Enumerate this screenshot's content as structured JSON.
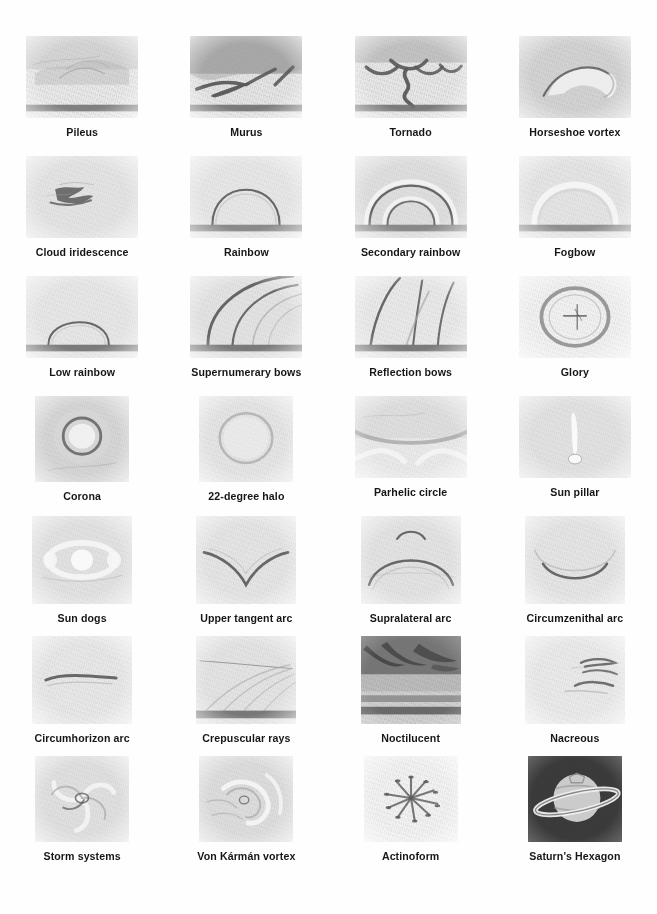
{
  "page": {
    "background_color": "#ffffff",
    "caption_color": "#15161a",
    "columns": 4,
    "rows": 7
  },
  "items": [
    {
      "label": "Pileus",
      "icon": "pileus-sketch",
      "sky": "#e8e8e8",
      "ground": true,
      "shape": "wide"
    },
    {
      "label": "Murus",
      "icon": "murus-sketch",
      "sky": "#e4e4e4",
      "ground": true,
      "shape": "wide"
    },
    {
      "label": "Tornado",
      "icon": "tornado-sketch",
      "sky": "#e6e6e6",
      "ground": true,
      "shape": "wide"
    },
    {
      "label": "Horseshoe vortex",
      "icon": "horseshoe-vortex-sketch",
      "sky": "#e3e3e3",
      "ground": false,
      "shape": "wide"
    },
    {
      "label": "Cloud iridescence",
      "icon": "cloud-iridescence-sketch",
      "sky": "#eaeaea",
      "ground": false,
      "shape": "wide"
    },
    {
      "label": "Rainbow",
      "icon": "rainbow-sketch",
      "sky": "#ececec",
      "ground": true,
      "shape": "wide"
    },
    {
      "label": "Secondary rainbow",
      "icon": "secondary-rainbow-sketch",
      "sky": "#e7e7e7",
      "ground": true,
      "shape": "wide"
    },
    {
      "label": "Fogbow",
      "icon": "fogbow-sketch",
      "sky": "#e9e9e9",
      "ground": true,
      "shape": "wide"
    },
    {
      "label": "Low rainbow",
      "icon": "low-rainbow-sketch",
      "sky": "#eaeaea",
      "ground": true,
      "shape": "wide"
    },
    {
      "label": "Supernumerary bows",
      "icon": "supernumerary-bows-sketch",
      "sky": "#e9e9e9",
      "ground": true,
      "shape": "wide"
    },
    {
      "label": "Reflection bows",
      "icon": "reflection-bows-sketch",
      "sky": "#ececec",
      "ground": true,
      "shape": "wide"
    },
    {
      "label": "Glory",
      "icon": "glory-sketch",
      "sky": "#f0f0f0",
      "ground": false,
      "shape": "wide"
    },
    {
      "label": "Corona",
      "icon": "corona-sketch",
      "sky": "#e4e4e4",
      "ground": false,
      "shape": "sq"
    },
    {
      "label": "22-degree halo",
      "icon": "halo-22-degree-sketch",
      "sky": "#e9e9e9",
      "ground": false,
      "shape": "sq"
    },
    {
      "label": "Parhelic circle",
      "icon": "parhelic-circle-sketch",
      "sky": "#e8e8e8",
      "ground": false,
      "shape": "wide"
    },
    {
      "label": "Sun pillar",
      "icon": "sun-pillar-sketch",
      "sky": "#e7e7e7",
      "ground": false,
      "shape": "wide"
    },
    {
      "label": "Sun dogs",
      "icon": "sun-dogs-sketch",
      "sky": "#e7e7e7",
      "ground": false,
      "shape": "tall"
    },
    {
      "label": "Upper tangent arc",
      "icon": "upper-tangent-arc-sketch",
      "sky": "#e9e9e9",
      "ground": false,
      "shape": "tall"
    },
    {
      "label": "Supralateral arc",
      "icon": "supralateral-arc-sketch",
      "sky": "#e8e8e8",
      "ground": false,
      "shape": "tall"
    },
    {
      "label": "Circumzenithal arc",
      "icon": "circumzenithal-arc-sketch",
      "sky": "#e9e9e9",
      "ground": false,
      "shape": "tall"
    },
    {
      "label": "Circumhorizon arc",
      "icon": "circumhorizon-arc-sketch",
      "sky": "#eaeaea",
      "ground": false,
      "shape": "tall"
    },
    {
      "label": "Crepuscular rays",
      "icon": "crepuscular-rays-sketch",
      "sky": "#e9e9e9",
      "ground": true,
      "shape": "tall"
    },
    {
      "label": "Noctilucent",
      "icon": "noctilucent-sketch",
      "sky": "#cfcfcf",
      "ground": true,
      "shape": "tall"
    },
    {
      "label": "Nacreous",
      "icon": "nacreous-sketch",
      "sky": "#ebebeb",
      "ground": false,
      "shape": "tall"
    },
    {
      "label": "Storm systems",
      "icon": "storm-systems-sketch",
      "sky": "#e7e7e7",
      "ground": false,
      "shape": "sq"
    },
    {
      "label": "Von Kármán vortex",
      "icon": "von-karman-vortex-sketch",
      "sky": "#e5e5e5",
      "ground": false,
      "shape": "sq"
    },
    {
      "label": "Actinoform",
      "icon": "actinoform-sketch",
      "sky": "#f2f2f2",
      "ground": false,
      "shape": "sq"
    },
    {
      "label": "Saturn's Hexagon",
      "icon": "saturns-hexagon-sketch",
      "sky": "#4a4a4a",
      "ground": false,
      "shape": "sq"
    }
  ]
}
